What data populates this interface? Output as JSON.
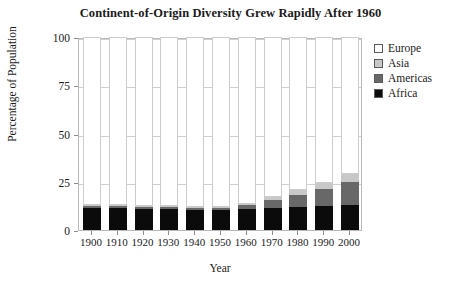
{
  "chart_data": {
    "type": "bar",
    "stacked": true,
    "title": "Continent-of-Origin Diversity Grew Rapidly After 1960",
    "xlabel": "Year",
    "ylabel": "Percentage of Population",
    "ylim": [
      0,
      100
    ],
    "yticks": [
      0,
      25,
      50,
      75,
      100
    ],
    "ytick_labels": [
      "0",
      "25",
      "50",
      "75",
      "100"
    ],
    "grid": true,
    "legend_position": "right",
    "categories": [
      "1900",
      "1910",
      "1920",
      "1930",
      "1940",
      "1950",
      "1960",
      "1970",
      "1980",
      "1990",
      "2000"
    ],
    "series": [
      {
        "name": "Africa",
        "color": "#0b0b0b",
        "values": [
          11.5,
          11.5,
          11.0,
          11.0,
          10.5,
          10.5,
          11.0,
          11.5,
          12.0,
          12.5,
          13.0
        ]
      },
      {
        "name": "Americas",
        "color": "#686868",
        "values": [
          1.0,
          1.0,
          1.0,
          1.0,
          1.0,
          1.0,
          2.0,
          4.0,
          6.0,
          9.0,
          12.0
        ]
      },
      {
        "name": "Asia",
        "color": "#c8c8c8",
        "values": [
          0.3,
          0.3,
          0.3,
          0.3,
          0.3,
          0.3,
          0.5,
          1.5,
          2.5,
          3.0,
          4.0
        ]
      },
      {
        "name": "Europe",
        "color": "#ffffff",
        "values": [
          87.2,
          87.2,
          87.7,
          87.7,
          88.2,
          88.2,
          86.5,
          83.0,
          79.5,
          75.5,
          71.0
        ]
      }
    ]
  },
  "legend": {
    "items": [
      {
        "label": "Europe",
        "color": "#ffffff"
      },
      {
        "label": "Asia",
        "color": "#c8c8c8"
      },
      {
        "label": "Americas",
        "color": "#686868"
      },
      {
        "label": "Africa",
        "color": "#0b0b0b"
      }
    ]
  }
}
